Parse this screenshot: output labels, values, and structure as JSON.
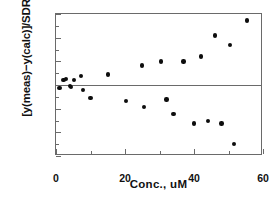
{
  "chart_data": {
    "type": "scatter",
    "title": "",
    "xlabel": "Conc.,  uM",
    "ylabel": "[y(meas)−y(calc)]/SDR",
    "xlim": [
      0,
      60
    ],
    "ylim": [
      -3,
      3
    ],
    "xticks": [
      0,
      20,
      40,
      60
    ],
    "xtick_labels": [
      "0",
      "20",
      "40",
      "60"
    ],
    "xminor_ticks": [
      10,
      30,
      50
    ],
    "yticks": [
      3,
      2,
      1,
      0,
      -1,
      -2,
      -3
    ],
    "ytick_labels": [
      "3",
      "2",
      "1",
      "0",
      "-1",
      "-2",
      "-3"
    ],
    "yminor_ticks": [
      2.5,
      1.5,
      0.5,
      -0.5,
      -1.5,
      -2.5
    ],
    "grid": false,
    "legend": null,
    "zero_reference_line": 0,
    "marker": "filled-circle",
    "marker_color": "#0d0d0d",
    "series": [
      {
        "name": "residuals",
        "points": [
          {
            "x": 1.0,
            "y": -0.12
          },
          {
            "x": 2.2,
            "y": 0.22
          },
          {
            "x": 2.9,
            "y": 0.25
          },
          {
            "x": 4.0,
            "y": -0.05
          },
          {
            "x": 4.3,
            "y": -0.08
          },
          {
            "x": 5.2,
            "y": 0.22
          },
          {
            "x": 7.2,
            "y": 0.38
          },
          {
            "x": 7.8,
            "y": -0.22
          },
          {
            "x": 10.0,
            "y": -0.55
          },
          {
            "x": 15.0,
            "y": 0.45
          },
          {
            "x": 20.2,
            "y": -0.68
          },
          {
            "x": 25.0,
            "y": 0.82
          },
          {
            "x": 25.5,
            "y": -0.92
          },
          {
            "x": 30.5,
            "y": 1.0
          },
          {
            "x": 32.0,
            "y": -0.62
          },
          {
            "x": 34.0,
            "y": -1.22
          },
          {
            "x": 37.0,
            "y": 1.0
          },
          {
            "x": 40.0,
            "y": -1.62
          },
          {
            "x": 42.0,
            "y": 1.2
          },
          {
            "x": 44.0,
            "y": -1.52
          },
          {
            "x": 46.0,
            "y": 2.1
          },
          {
            "x": 48.0,
            "y": -1.62
          },
          {
            "x": 50.5,
            "y": 1.7
          },
          {
            "x": 51.6,
            "y": -2.5
          },
          {
            "x": 55.4,
            "y": 2.72
          }
        ]
      }
    ]
  }
}
